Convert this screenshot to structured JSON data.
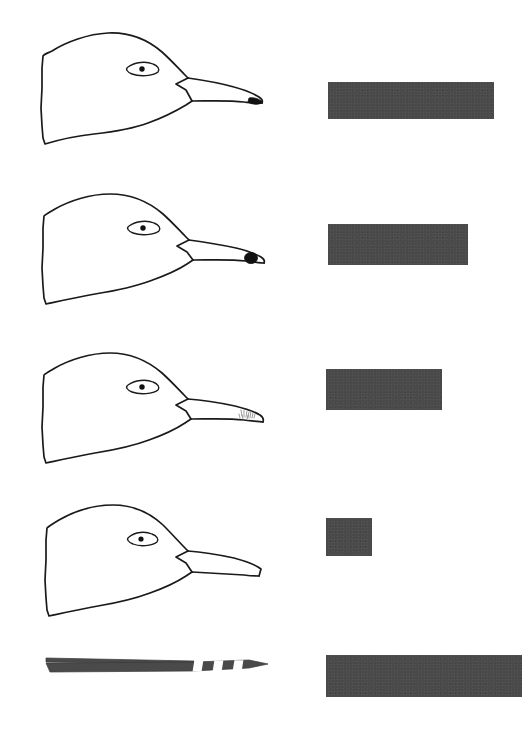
{
  "figure": {
    "background_color": "#ffffff",
    "ink_color": "#1a1a1a",
    "bar_color": "#4a4a4a",
    "width": 529,
    "height": 733,
    "row_count": 5
  },
  "rows": [
    {
      "index": 1,
      "specimen_name": "bird-head-profile-1",
      "specimen_type": "head",
      "bill_marking": "black-nail-wedge",
      "bill_marking_color": "#111111",
      "bill_shape": "long-pointed",
      "eye": "almond-with-pupil",
      "bar": {
        "x": 328,
        "y": 82,
        "width": 166,
        "height": 37,
        "color": "#4a4a4a"
      }
    },
    {
      "index": 2,
      "specimen_name": "bird-head-profile-2",
      "specimen_type": "head",
      "bill_marking": "round-black-spot",
      "bill_marking_color": "#111111",
      "bill_shape": "long-pointed",
      "eye": "almond-with-pupil",
      "bar": {
        "x": 328,
        "y": 224,
        "width": 140,
        "height": 41,
        "color": "#4a4a4a"
      }
    },
    {
      "index": 3,
      "specimen_name": "bird-head-profile-3",
      "specimen_type": "head",
      "bill_marking": "faint-stipple-patch",
      "bill_marking_color": "#8a8a8a",
      "bill_shape": "long-pointed",
      "eye": "almond-with-pupil",
      "bar": {
        "x": 326,
        "y": 369,
        "width": 116,
        "height": 41,
        "color": "#4a4a4a"
      }
    },
    {
      "index": 4,
      "specimen_name": "bird-head-profile-4",
      "specimen_type": "head",
      "bill_marking": "none",
      "bill_marking_color": "#ffffff",
      "bill_shape": "blunt-truncated",
      "eye": "almond-with-pupil",
      "bar": {
        "x": 326,
        "y": 518,
        "width": 46,
        "height": 38,
        "color": "#4a4a4a"
      }
    },
    {
      "index": 5,
      "specimen_name": "banded-feather",
      "specimen_type": "feather",
      "bill_marking": "three-white-bands",
      "bill_marking_color": "#ffffff",
      "bill_shape": "tapered-point",
      "eye": "none",
      "bar": {
        "x": 326,
        "y": 655,
        "width": 196,
        "height": 42,
        "color": "#4a4a4a"
      }
    }
  ],
  "chart_data": {
    "type": "bar",
    "title": "",
    "xlabel": "",
    "ylabel": "",
    "orientation": "horizontal",
    "grid": false,
    "legend": "none",
    "categories": [
      "bird-head-profile-1",
      "bird-head-profile-2",
      "bird-head-profile-3",
      "bird-head-profile-4",
      "banded-feather"
    ],
    "values": [
      166,
      140,
      116,
      46,
      196
    ],
    "value_unit": "px bar length",
    "xlim": [
      0,
      196
    ],
    "bar_color": "#4a4a4a"
  }
}
